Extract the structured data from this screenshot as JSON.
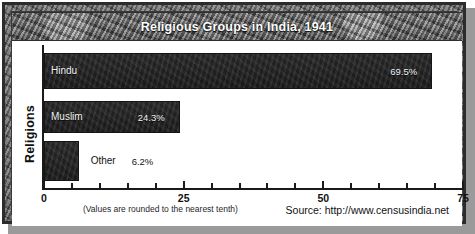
{
  "chart_data": {
    "type": "bar",
    "orientation": "horizontal",
    "title": "Religious Groups in India, 1941",
    "xlabel": "",
    "ylabel": "Religions",
    "categories": [
      "Hindu",
      "Muslim",
      "Other"
    ],
    "values": [
      69.5,
      24.3,
      6.2
    ],
    "value_labels": [
      "69.5%",
      "24.3%",
      "6.2%"
    ],
    "xlim": [
      0,
      75
    ],
    "tick_interval": 5,
    "major_ticks": [
      0,
      25,
      50,
      75
    ],
    "major_tick_labels": [
      "0",
      "25",
      "50",
      "75"
    ],
    "all_ticks": [
      0,
      5,
      10,
      15,
      20,
      25,
      30,
      35,
      40,
      45,
      50,
      55,
      60,
      65,
      70,
      75
    ],
    "grid": false,
    "legend": "none",
    "bar_color": "#232323",
    "label_color_inside": "#f2f2f2",
    "label_color_outside": "#141414"
  },
  "footer": {
    "note": "(Values are rounded to the nearest tenth)",
    "source": "Source: http://www.censusindia.net"
  },
  "theme": {
    "frame_color": "#636363",
    "banner_color": "#6e6e6e",
    "title_color": "#ffffff",
    "axis_color": "#1a1a1a",
    "background": "#ffffff"
  }
}
